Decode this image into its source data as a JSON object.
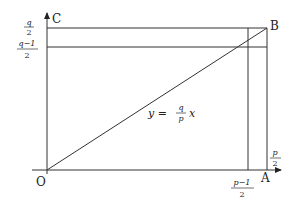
{
  "diagram": {
    "points": {
      "origin": "O",
      "x_axis_end": "A",
      "corner": "B",
      "y_axis_end": "C"
    },
    "x_labels": {
      "half_p_minus_1": {
        "num": "p−1",
        "den": "2"
      },
      "half_p": {
        "num": "p",
        "den": "2"
      }
    },
    "y_labels": {
      "half_q": {
        "num": "q",
        "den": "2"
      },
      "half_q_minus_1": {
        "num": "q−1",
        "den": "2"
      }
    },
    "line_equation": {
      "lhs": "y =",
      "frac_num": "q",
      "frac_den": "p",
      "rhs": "x"
    },
    "colors": {
      "stroke": "#333333",
      "background": "#ffffff"
    }
  }
}
